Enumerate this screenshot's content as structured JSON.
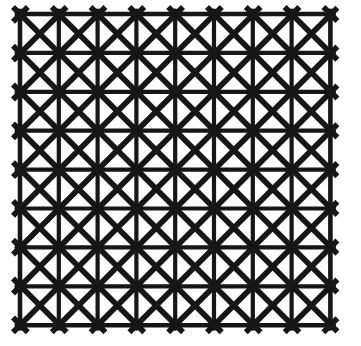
{
  "image": {
    "title": "Geometric lattice grid pattern",
    "description": "Black-and-white photograph of a square lattice screen: an 8 by 8 grid of square cells, each crossed by both diagonals forming X shapes, with eight-spoke star intersections at every grid node.",
    "width": 361,
    "height": 346,
    "background_color": "#ffffff",
    "line_color": "#141414",
    "medium": "monochrome photograph"
  },
  "pattern": {
    "name": "square-lattice-with-diagonals",
    "columns": 8,
    "rows": 8,
    "cell_width": 38.8,
    "cell_height": 38.9,
    "origin_x": 20,
    "origin_y": 14,
    "grid_line_width": 4.2,
    "diagonal_line_width": 5.6,
    "diagonal_overshoot": 7,
    "border_line_width": 4.6,
    "has_horizontal_lines": true,
    "has_vertical_lines": true,
    "has_diagonals_both_directions": true,
    "node_star_spokes": 8,
    "node_radius": 5.5
  },
  "chart_data": {
    "type": "scatter",
    "xlabel": "",
    "ylabel": "",
    "grid": true,
    "legend": "none",
    "xlim": [
      20,
      330
    ],
    "ylim": [
      14,
      325
    ],
    "x_ticks": [
      20,
      58.8,
      97.6,
      136.4,
      175.2,
      214,
      252.8,
      291.6,
      330.4
    ],
    "y_ticks": [
      14,
      52.9,
      91.8,
      130.7,
      169.6,
      208.5,
      247.4,
      286.3,
      325.2
    ]
  },
  "texture": {
    "vignette_opacity": 0.05,
    "paper_tint": "#fdfdfd",
    "edge_softness": 0.6
  }
}
